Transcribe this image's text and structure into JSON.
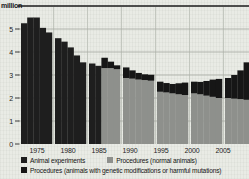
{
  "chart_data": {
    "type": "bar",
    "stacked": true,
    "title": "",
    "y_unit": "million",
    "ylabel": "million",
    "xlabel": "",
    "ylim": [
      0,
      6
    ],
    "yticks": [
      0,
      1,
      2,
      3,
      4,
      5
    ],
    "x_labels": [
      "1975",
      "1980",
      "1985",
      "1990",
      "1995",
      "2000",
      "2005"
    ],
    "grouping": "yearly bars drawn in 5-year blocks separated by gaps",
    "series": [
      {
        "key": "experiments",
        "name": "Animal experiments",
        "color": "#1e1e1e"
      },
      {
        "key": "normal",
        "name": "Procedures (normal animals)",
        "color": "#8e908c"
      },
      {
        "key": "gm",
        "name": "Procedures (animals with genetic modifications or harmful mutations)",
        "color": "#161616"
      }
    ],
    "years": [
      {
        "year": 1975,
        "experiments": 5.25
      },
      {
        "year": 1976,
        "experiments": 5.5
      },
      {
        "year": 1977,
        "experiments": 5.5
      },
      {
        "year": 1978,
        "experiments": 5.05
      },
      {
        "year": 1979,
        "experiments": 4.85
      },
      {
        "year": 1980,
        "experiments": 4.6
      },
      {
        "year": 1981,
        "experiments": 4.45
      },
      {
        "year": 1982,
        "experiments": 4.2
      },
      {
        "year": 1983,
        "experiments": 3.85
      },
      {
        "year": 1984,
        "experiments": 3.55
      },
      {
        "year": 1985,
        "experiments": 3.5
      },
      {
        "year": 1986,
        "experiments": 3.4
      },
      {
        "year": 1987,
        "normal": 3.3,
        "gm": 0.45
      },
      {
        "year": 1988,
        "normal": 3.3,
        "gm": 0.28
      },
      {
        "year": 1989,
        "normal": 3.25,
        "gm": 0.17
      },
      {
        "year": 1990,
        "normal": 2.87,
        "gm": 0.46
      },
      {
        "year": 1991,
        "normal": 2.84,
        "gm": 0.36
      },
      {
        "year": 1992,
        "normal": 2.8,
        "gm": 0.29
      },
      {
        "year": 1993,
        "normal": 2.78,
        "gm": 0.25
      },
      {
        "year": 1994,
        "normal": 2.75,
        "gm": 0.26
      },
      {
        "year": 1995,
        "normal": 2.27,
        "gm": 0.44
      },
      {
        "year": 1996,
        "normal": 2.24,
        "gm": 0.41
      },
      {
        "year": 1997,
        "normal": 2.2,
        "gm": 0.41
      },
      {
        "year": 1998,
        "normal": 2.16,
        "gm": 0.48
      },
      {
        "year": 1999,
        "normal": 2.13,
        "gm": 0.54
      },
      {
        "year": 2000,
        "normal": 2.2,
        "gm": 0.51
      },
      {
        "year": 2001,
        "normal": 2.16,
        "gm": 0.54
      },
      {
        "year": 2002,
        "normal": 2.1,
        "gm": 0.64
      },
      {
        "year": 2003,
        "normal": 2.05,
        "gm": 0.75
      },
      {
        "year": 2004,
        "normal": 2.0,
        "gm": 0.83
      },
      {
        "year": 2005,
        "normal": 2.0,
        "gm": 0.87
      },
      {
        "year": 2006,
        "normal": 1.97,
        "gm": 1.03
      },
      {
        "year": 2007,
        "normal": 1.95,
        "gm": 1.25
      },
      {
        "year": 2008,
        "normal": 1.92,
        "gm": 1.63
      }
    ]
  }
}
